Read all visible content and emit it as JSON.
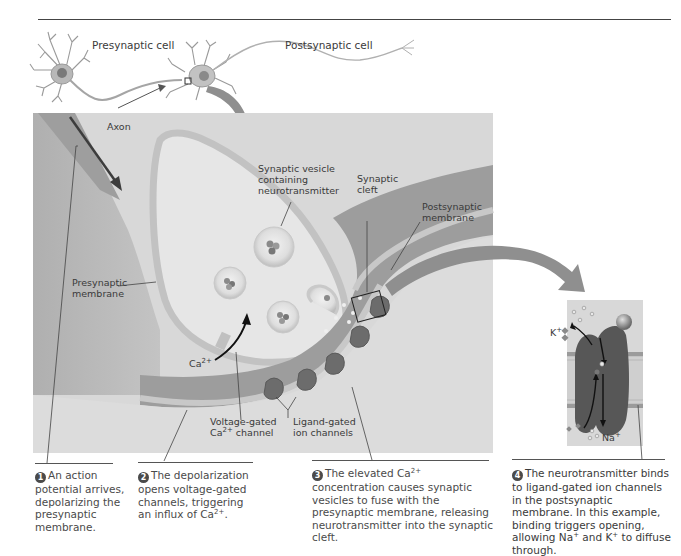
{
  "figure": {
    "overview": {
      "presynaptic_label": "Presynaptic cell",
      "postsynaptic_label": "Postsynaptic cell"
    },
    "main_panel": {
      "labels": {
        "axon": "Axon",
        "synaptic_vesicle_line1": "Synaptic vesicle",
        "synaptic_vesicle_line2": "containing",
        "synaptic_vesicle_line3": "neurotransmitter",
        "synaptic_cleft_line1": "Synaptic",
        "synaptic_cleft_line2": "cleft",
        "postsynaptic_membrane_line1": "Postsynaptic",
        "postsynaptic_membrane_line2": "membrane",
        "presynaptic_membrane_line1": "Presynaptic",
        "presynaptic_membrane_line2": "membrane",
        "calcium_ion_base": "Ca",
        "calcium_ion_charge": "2+",
        "voltage_gated_line1": "Voltage-gated",
        "voltage_gated_line2_base": "Ca",
        "voltage_gated_line2_charge": "2+",
        "voltage_gated_line2_rest": " channel",
        "ligand_gated_line1": "Ligand-gated",
        "ligand_gated_line2": "ion channels"
      }
    },
    "inset": {
      "potassium_base": "K",
      "potassium_charge": "+",
      "sodium_base": "Na",
      "sodium_charge": "+"
    },
    "steps": [
      {
        "number": "1",
        "text": "An action potential arrives, depolarizing the presynaptic membrane."
      },
      {
        "number": "2",
        "text_before": "The depolarization opens voltage-gated channels, triggering an influx of Ca",
        "sup": "2+",
        "text_after": "."
      },
      {
        "number": "3",
        "text_before": "The elevated Ca",
        "sup": "2+",
        "text_after": " concentration causes synaptic vesicles to fuse with the presynaptic membrane, releasing neurotransmitter into the synaptic cleft."
      },
      {
        "number": "4",
        "text_a": "The neurotransmitter binds to ligand-gated ion channels in the postsynaptic membrane. In this example, binding triggers opening, allowing Na",
        "sup_a": "+",
        "text_b": " and K",
        "sup_b": "+",
        "text_c": " to diffuse through."
      }
    ],
    "colors": {
      "background_panel": "#d9d9d9",
      "axon_fill": "#a9a9a9",
      "terminal_fill": "#e4e4e4",
      "membrane": "#c4c4c4",
      "postsynaptic_fill": "#9c9c9c",
      "channel_fill": "#6e6e6e",
      "arrow_fill": "#8f8f8f",
      "text": "#3a3a3a",
      "caption_text": "#4a4a4a"
    }
  }
}
